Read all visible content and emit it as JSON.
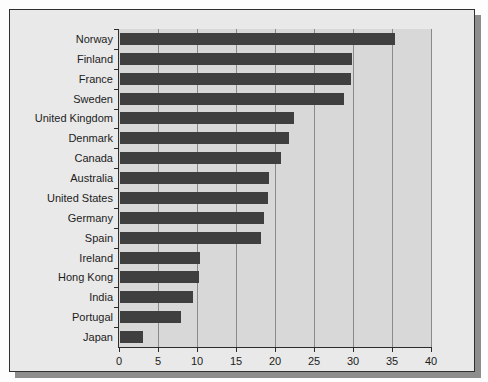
{
  "chart_data": {
    "type": "bar",
    "orientation": "horizontal",
    "title": "",
    "subtitle": "",
    "xlabel": "",
    "ylabel": "",
    "xlim": [
      0,
      40
    ],
    "ylim": null,
    "grid": true,
    "legend": null,
    "legend_position": "none",
    "xticks": [
      0,
      5,
      10,
      15,
      20,
      25,
      30,
      35,
      40
    ],
    "xticklabels": [
      "0",
      "5",
      "10",
      "15",
      "20",
      "25",
      "30",
      "35",
      "40"
    ],
    "categories": [
      "Norway",
      "Finland",
      "France",
      "Sweden",
      "United Kingdom",
      "Denmark",
      "Canada",
      "Australia",
      "United States",
      "Germany",
      "Spain",
      "Ireland",
      "Hong Kong",
      "India",
      "Portugal",
      "Japan"
    ],
    "values": [
      35.3,
      29.8,
      29.6,
      28.7,
      22.3,
      21.7,
      20.7,
      19.1,
      19.0,
      18.4,
      18.1,
      10.2,
      10.1,
      9.3,
      7.8,
      3.0
    ],
    "colors": {
      "bar": "#3f3f3f",
      "plot_background": "#d8d8d8",
      "figure_background": "#e9e9e9",
      "outer_background": "#fdfdfd",
      "gridline": "#8a8a8a",
      "axis": "#2c2c2c",
      "text": "#1c1c1c",
      "frame_border": "#2f2f2f",
      "frame_shadow": "#8d8d8d"
    }
  }
}
